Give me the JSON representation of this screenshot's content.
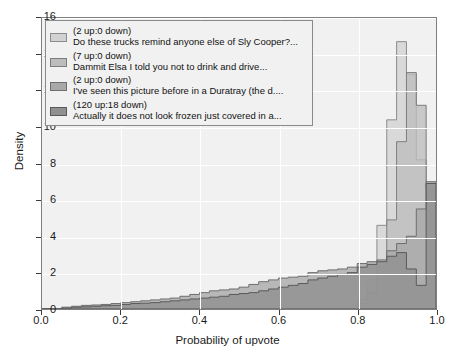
{
  "chart_data": {
    "type": "bar",
    "title": "",
    "xlabel": "Probability of upvote",
    "ylabel": "Density",
    "xlim": [
      0.0,
      1.0
    ],
    "ylim": [
      0,
      16
    ],
    "xticks": [
      "0.0",
      "0.2",
      "0.4",
      "0.6",
      "0.8",
      "1.0"
    ],
    "yticks": [
      "0",
      "2",
      "4",
      "6",
      "8",
      "10",
      "12",
      "14",
      "16"
    ],
    "grid": true,
    "legend_position": "upper left",
    "bin_width": 0.025,
    "bin_edges": [
      0.0,
      0.025,
      0.05,
      0.075,
      0.1,
      0.125,
      0.15,
      0.175,
      0.2,
      0.225,
      0.25,
      0.275,
      0.3,
      0.325,
      0.35,
      0.375,
      0.4,
      0.425,
      0.45,
      0.475,
      0.5,
      0.525,
      0.55,
      0.575,
      0.6,
      0.625,
      0.65,
      0.675,
      0.7,
      0.725,
      0.75,
      0.775,
      0.8,
      0.825,
      0.85,
      0.875,
      0.9,
      0.925,
      0.95,
      0.975,
      1.0
    ],
    "series": [
      {
        "name": "Do these trucks remind anyone else of Sly Cooper?...",
        "votes": "(2 up:0 down)",
        "color": "#d2d2d2",
        "edge_color": "#8c8c8c",
        "values": [
          0,
          0,
          0,
          0,
          0,
          0,
          0,
          0,
          0,
          0,
          0,
          0,
          0,
          0,
          0,
          0,
          0,
          0,
          0,
          0,
          0,
          0,
          0,
          0,
          0,
          0,
          0,
          0,
          0,
          0,
          0,
          0,
          0.5,
          1.6,
          4.6,
          10.4,
          14.7,
          12.9,
          8.2,
          5.1
        ]
      },
      {
        "name": "Dammit Elsa I told you not to drink and drive...",
        "votes": "(7 up:0 down)",
        "color": "#bdbdbd",
        "edge_color": "#7d7d7d",
        "values": [
          0,
          0,
          0,
          0,
          0,
          0,
          0,
          0,
          0,
          0,
          0,
          0,
          0,
          0,
          0,
          0,
          0,
          0,
          0,
          0,
          0,
          0,
          0,
          0,
          0,
          0,
          0,
          0,
          0,
          0,
          0,
          0,
          0.3,
          0.9,
          2.3,
          4.9,
          9.2,
          13.0,
          11.2,
          6.6
        ]
      },
      {
        "name": "I've seen this picture before in a Duratray (the d....",
        "votes": "(2 up:0 down)",
        "color": "#a8a8a8",
        "edge_color": "#6e6e6e",
        "values": [
          0,
          0,
          0.1,
          0.15,
          0.2,
          0.22,
          0.25,
          0.3,
          0.35,
          0.4,
          0.45,
          0.5,
          0.55,
          0.6,
          0.7,
          0.8,
          0.9,
          1.0,
          1.05,
          1.1,
          1.2,
          1.35,
          1.5,
          1.6,
          1.7,
          1.75,
          1.8,
          2.0,
          2.1,
          2.15,
          2.2,
          2.3,
          2.5,
          2.6,
          2.7,
          3.2,
          3.6,
          4.0,
          5.5,
          7.0
        ]
      },
      {
        "name": "Actually it does not look frozen just covered in a...",
        "votes": "(120 up:18 down)",
        "color": "#909090",
        "edge_color": "#5a5a5a",
        "values": [
          0,
          0,
          0.05,
          0.1,
          0.12,
          0.15,
          0.18,
          0.2,
          0.25,
          0.3,
          0.32,
          0.35,
          0.4,
          0.45,
          0.5,
          0.55,
          0.6,
          0.65,
          0.7,
          0.8,
          0.85,
          0.9,
          1.0,
          1.1,
          1.2,
          1.3,
          1.4,
          1.6,
          1.7,
          1.8,
          1.9,
          2.0,
          2.3,
          2.45,
          2.6,
          2.9,
          3.1,
          2.2,
          1.3,
          6.9
        ]
      }
    ]
  }
}
